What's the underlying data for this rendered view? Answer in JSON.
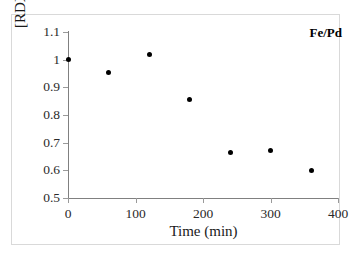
{
  "chart_data": {
    "type": "scatter",
    "title": "",
    "xlabel": "Time (min)",
    "ylabel": "[RDX] / [RDX]0",
    "ylabel_main": "[RDX] / [RDX]",
    "ylabel_sub": "0",
    "xlim": [
      0,
      400
    ],
    "ylim": [
      0.5,
      1.1
    ],
    "xticks": [
      0,
      100,
      200,
      300,
      400
    ],
    "xtick_labels": [
      "0",
      "100",
      "200",
      "300",
      "400"
    ],
    "yticks": [
      0.5,
      0.6,
      0.7,
      0.8,
      0.9,
      1.0,
      1.1
    ],
    "ytick_labels": [
      "0.5",
      "0.6",
      "0.7",
      "0.8",
      "0.9",
      "1",
      "1.1"
    ],
    "grid": false,
    "legend_position": "top-right",
    "annotation": "Fe/Pd",
    "marker": "filled-circle",
    "marker_color": "#000000",
    "series": [
      {
        "name": "Fe/Pd",
        "x": [
          0,
          60,
          120,
          180,
          240,
          300,
          360
        ],
        "values": [
          1.0,
          0.955,
          1.02,
          0.855,
          0.665,
          0.67,
          0.6
        ]
      }
    ]
  }
}
